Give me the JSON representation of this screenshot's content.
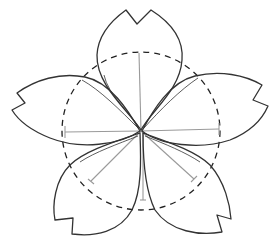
{
  "diagram": {
    "background": "#ffffff",
    "center": [
      141,
      131
    ],
    "guide_circle": {
      "cx": 141,
      "cy": 131,
      "r": 79,
      "style": "dashed",
      "color": "#222222"
    },
    "guide_lines_color": "#9a9a9a",
    "outline_color": "#333333",
    "petal_count": 5,
    "petals": [
      "top",
      "left",
      "right",
      "bottom-left",
      "bottom-right"
    ]
  }
}
